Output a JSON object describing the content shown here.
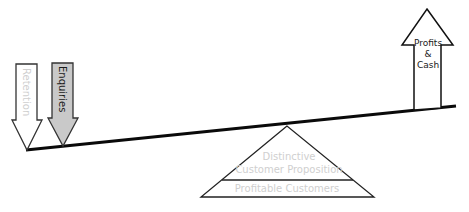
{
  "diagram": {
    "type": "balance-scale",
    "colors": {
      "background": "#ffffff",
      "stroke": "#111111",
      "beam": "#0a0a0a",
      "enquiries_fill": "#c9c9c9",
      "faint_text": "#cfcfcf",
      "dark_text": "#1a1a1a"
    },
    "left_arrows": [
      {
        "label": "Retention",
        "direction": "down",
        "fill": "#ffffff"
      },
      {
        "label": "Enquiries",
        "direction": "down",
        "fill": "#c9c9c9"
      }
    ],
    "right_arrow": {
      "label_line1": "Profits",
      "label_line2": "&",
      "label_line3": "Cash",
      "direction": "up"
    },
    "fulcrum": {
      "top_label_line1": "Distinctive",
      "top_label_line2": "Customer Proposition",
      "base_label": "Profitable Customers"
    }
  }
}
